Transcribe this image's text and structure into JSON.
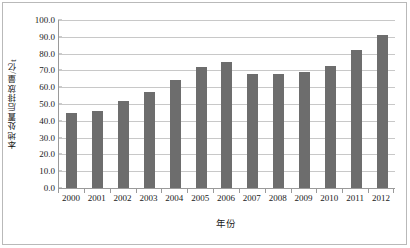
{
  "chart_data": {
    "type": "bar",
    "title": "",
    "subtitle": "",
    "xlabel": "年份",
    "ylabel": "本地处置后排放量/亿t",
    "categories": [
      "2000",
      "2001",
      "2002",
      "2003",
      "2004",
      "2005",
      "2006",
      "2007",
      "2008",
      "2009",
      "2010",
      "2011",
      "2012"
    ],
    "values": [
      44.5,
      46.0,
      51.5,
      57.0,
      64.5,
      72.0,
      74.8,
      68.0,
      67.8,
      69.2,
      72.5,
      82.3,
      91.0
    ],
    "series": [
      {
        "name": "本地处置后排放量",
        "values": [
          44.5,
          46.0,
          51.5,
          57.0,
          64.5,
          72.0,
          74.8,
          68.0,
          67.8,
          69.2,
          72.5,
          82.3,
          91.0
        ]
      }
    ],
    "ylim": [
      0.0,
      100.0
    ],
    "ytick_step": 10.0,
    "ytick_labels": [
      "0.0",
      "10.0",
      "20.0",
      "30.0",
      "40.0",
      "50.0",
      "60.0",
      "70.0",
      "80.0",
      "90.0",
      "100.0"
    ],
    "ytick_values": [
      0,
      10,
      20,
      30,
      40,
      50,
      60,
      70,
      80,
      90,
      100
    ],
    "grid": true,
    "grid_axis": "y",
    "legend": false,
    "legend_position": "none",
    "bar_color": "#6d6d6d",
    "gridline_color": "#c8c8c8",
    "axis_color": "#9a9a9a",
    "plot_background": "#ffffff",
    "annotations": []
  }
}
